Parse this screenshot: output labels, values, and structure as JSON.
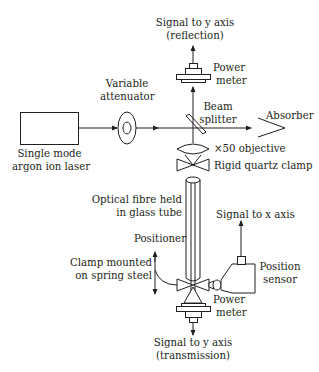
{
  "diagram": {
    "components": {
      "laser": {
        "line1": "Single mode",
        "line2": "argon ion laser"
      },
      "attenuator": {
        "line1": "Variable",
        "line2": "attenuator"
      },
      "beam_splitter": {
        "line1": "Beam",
        "line2": "splitter"
      },
      "absorber": {
        "label": "Absorber"
      },
      "power_meter_top": {
        "line1": "Power",
        "line2": "meter"
      },
      "signal_reflection": {
        "line1": "Signal to y axis",
        "line2": "(reflection)"
      },
      "objective": {
        "label": "×50 objective"
      },
      "quartz_clamp": {
        "label": "Rigid quartz clamp"
      },
      "fibre": {
        "line1": "Optical fibre held",
        "line2": "in glass tube"
      },
      "signal_x": {
        "label": "Signal to x axis"
      },
      "positioner": {
        "label": "Positioner"
      },
      "spring_clamp": {
        "line1": "Clamp mounted",
        "line2": "on spring steel"
      },
      "position_sensor": {
        "line1": "Position",
        "line2": "sensor"
      },
      "power_meter_bottom": {
        "line1": "Power",
        "line2": "meter"
      },
      "signal_transmission": {
        "line1": "Signal to y axis",
        "line2": "(transmission)"
      }
    },
    "colors": {
      "ink": "#231f20",
      "background": "#ffffff"
    }
  }
}
